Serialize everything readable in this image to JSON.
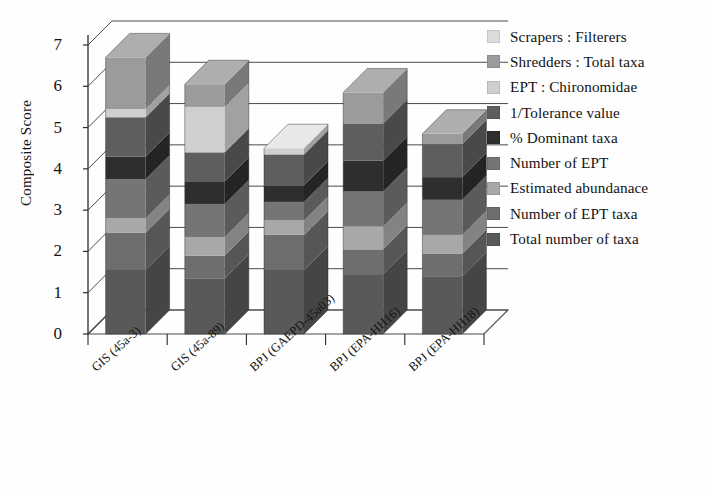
{
  "chart_data": {
    "type": "bar",
    "subtype": "stacked-3d-column",
    "title": "",
    "xlabel": "",
    "ylabel": "Composite Score",
    "ylim": [
      0,
      7
    ],
    "yticks": [
      0,
      1,
      2,
      3,
      4,
      5,
      6,
      7
    ],
    "grid": true,
    "legend_position": "right",
    "categories": [
      "GIS (45a-3)",
      "GIS (45a-89)",
      "BPJ (GAEPD-45a03)",
      "BPJ (EPA-HH16)",
      "BPJ (EPA-HH18)"
    ],
    "series": [
      {
        "name": "Total number of taxa",
        "color": "#595959",
        "values": [
          1.55,
          1.35,
          1.55,
          1.45,
          1.4
        ]
      },
      {
        "name": "Number of EPT taxa",
        "color": "#6e6e6e",
        "values": [
          0.9,
          0.55,
          0.85,
          0.6,
          0.55
        ]
      },
      {
        "name": "Estimated abundanace",
        "color": "#a8a8a8",
        "values": [
          0.35,
          0.45,
          0.35,
          0.55,
          0.45
        ]
      },
      {
        "name": "Number of EPT",
        "color": "#757575",
        "values": [
          0.95,
          0.8,
          0.45,
          0.85,
          0.85
        ]
      },
      {
        "name": "% Dominant taxa",
        "color": "#2e2e2e",
        "values": [
          0.55,
          0.55,
          0.4,
          0.75,
          0.55
        ]
      },
      {
        "name": "1/Tolerance value",
        "color": "#5e5e5e",
        "values": [
          0.95,
          0.7,
          0.75,
          0.9,
          0.8
        ]
      },
      {
        "name": "EPT : Chironomidae",
        "color": "#cfcfcf",
        "values": [
          0.2,
          1.1,
          0.15,
          0.0,
          0.0
        ]
      },
      {
        "name": "Shredders : Total taxa",
        "color": "#9b9b9b",
        "values": [
          1.25,
          0.55,
          0.0,
          0.75,
          0.25
        ]
      },
      {
        "name": "Scrapers : Filterers",
        "color": "#dcdcdc",
        "values": [
          0.0,
          0.0,
          0.0,
          0.0,
          0.0
        ]
      }
    ],
    "totals": [
      6.7,
      6.05,
      4.5,
      5.85,
      4.85
    ]
  },
  "legend": {
    "items": [
      {
        "label": "Scrapers : Filterers",
        "color": "#dcdcdc"
      },
      {
        "label": "Shredders : Total taxa",
        "color": "#9b9b9b"
      },
      {
        "label": "EPT : Chironomidae",
        "color": "#cfcfcf"
      },
      {
        "label": "1/Tolerance value",
        "color": "#5e5e5e"
      },
      {
        "label": "% Dominant taxa",
        "color": "#2e2e2e"
      },
      {
        "label": "Number of EPT",
        "color": "#757575"
      },
      {
        "label": "Estimated abundanace",
        "color": "#a8a8a8"
      },
      {
        "label": "Number of EPT taxa",
        "color": "#6e6e6e"
      },
      {
        "label": "Total number of taxa",
        "color": "#595959"
      }
    ]
  },
  "axes": {
    "y_title": "Composite Score",
    "y_tick_labels": [
      "7",
      "6",
      "5",
      "4",
      "3",
      "2",
      "1",
      "0"
    ],
    "x_tick_labels": [
      "GIS (45a-3)",
      "GIS (45a-89)",
      "BPJ (GAEPD-45a03)",
      "BPJ (EPA-HH16)",
      "BPJ (EPA-HH18)"
    ]
  }
}
